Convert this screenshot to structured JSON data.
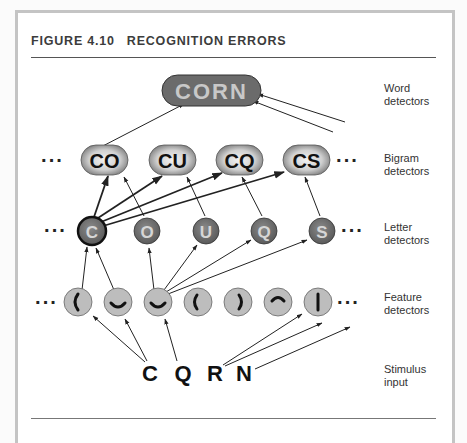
{
  "figure": {
    "number": "FIGURE 4.10",
    "title": "RECOGNITION ERRORS"
  },
  "layers": {
    "word": {
      "label_line1": "Word",
      "label_line2": "detectors"
    },
    "bigram": {
      "label_line1": "Bigram",
      "label_line2": "detectors"
    },
    "letter": {
      "label_line1": "Letter",
      "label_line2": "detectors"
    },
    "feature": {
      "label_line1": "Feature",
      "label_line2": "detectors"
    },
    "stimulus": {
      "label_line1": "Stimulus",
      "label_line2": "input"
    }
  },
  "word_detectors": [
    "CORN"
  ],
  "bigram_detectors": [
    "CO",
    "CU",
    "CQ",
    "CS"
  ],
  "letter_detectors": [
    "C",
    "O",
    "U",
    "Q",
    "S"
  ],
  "feature_detectors": [
    "left-curve",
    "bottom-curve",
    "bottom-curve",
    "left-curve",
    "right-curve",
    "top-curve",
    "vertical-line"
  ],
  "stimulus": [
    "C",
    "Q",
    "R",
    "N"
  ],
  "ellipsis": "···",
  "highlighted_letter": "C",
  "colors": {
    "word_node": "#6b6b6b",
    "word_text": "#c8c8c8",
    "bigram_node": "#9a9a9a",
    "letter_node": "#707070",
    "feature_node": "#bdbdbd",
    "text_dark": "#111111"
  }
}
